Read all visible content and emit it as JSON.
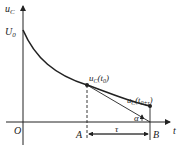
{
  "diagram": {
    "type": "RC discharge curve with tangent",
    "axes": {
      "y_label_main": "u",
      "y_label_sub": "C",
      "x_label": "t",
      "origin_label": "O"
    },
    "labels": {
      "initial_value_main": "U",
      "initial_value_sub": "0",
      "point_a_label": "A",
      "point_b_label": "B",
      "point_t0_main": "u",
      "point_t0_sub": "C",
      "point_t0_arg": "(t",
      "point_t0_arg_sub": "0",
      "point_t0_close": ")",
      "point_t0tau_main": "u",
      "point_t0tau_sub": "C",
      "point_t0tau_arg": "(t",
      "point_t0tau_arg_sub": "0+τ",
      "point_t0tau_close": ")",
      "angle_label": "α",
      "interval_label": "τ"
    },
    "colors": {
      "stroke": "#222222",
      "background": "#ffffff"
    }
  }
}
